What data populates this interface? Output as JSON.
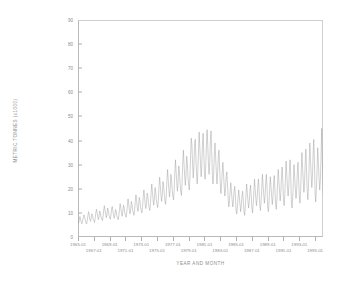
{
  "chart_data": {
    "type": "line",
    "title": "",
    "xlabel": "YEAR AND MONTH",
    "ylabel": "METRIC TONNES (x1000)",
    "ylim": [
      0,
      90
    ],
    "yticks": [
      0,
      10,
      20,
      30,
      40,
      50,
      60,
      70,
      80,
      90
    ],
    "ytick_labels": [
      "0",
      "10",
      "20",
      "30",
      "40",
      "50",
      "60",
      "70",
      "80",
      "90"
    ],
    "grid": false,
    "legend": null,
    "line_color": "#999999",
    "xlim_labels": [
      "1965.01",
      "1995.12"
    ],
    "xticks_top_row": [
      "1965.01",
      "1969.01",
      "1973.01",
      "1977.01",
      "1981.01",
      "1985.01",
      "1989.01",
      "1993.01"
    ],
    "xticks_bottom_row": [
      "1967.01",
      "1971.01",
      "1975.01",
      "1979.01",
      "1983.01",
      "1987.01",
      "1991.01",
      "1995.01"
    ],
    "x_start_year": 1965,
    "x_end_year": 1996,
    "series": [
      {
        "name": "monthly landings",
        "values": [
          6.5,
          5.8,
          7.2,
          8.5,
          7.0,
          6.2,
          5.5,
          6.8,
          8.0,
          9.2,
          8.4,
          7.1,
          6.0,
          5.4,
          6.6,
          8.8,
          10.5,
          9.0,
          7.4,
          6.5,
          7.8,
          9.6,
          8.8,
          7.5,
          6.8,
          6.0,
          7.5,
          9.8,
          11.5,
          10.2,
          8.5,
          7.2,
          8.6,
          10.8,
          9.8,
          8.2,
          7.5,
          6.8,
          8.4,
          11.0,
          13.0,
          11.2,
          9.4,
          8.0,
          9.5,
          12.0,
          11.0,
          9.0,
          8.2,
          7.4,
          9.0,
          11.8,
          12.6,
          10.8,
          9.0,
          7.8,
          9.2,
          11.4,
          10.6,
          8.8,
          8.0,
          7.2,
          8.8,
          11.4,
          13.8,
          12.0,
          10.0,
          8.6,
          10.4,
          13.2,
          12.2,
          10.0,
          9.0,
          8.2,
          10.0,
          13.2,
          15.8,
          13.6,
          11.2,
          9.6,
          11.6,
          14.8,
          13.6,
          11.2,
          10.0,
          9.0,
          11.2,
          14.8,
          17.5,
          15.0,
          12.4,
          10.6,
          12.8,
          16.4,
          15.0,
          12.4,
          11.0,
          10.0,
          12.4,
          16.5,
          19.5,
          16.8,
          13.8,
          11.8,
          14.2,
          18.2,
          16.8,
          13.8,
          12.2,
          11.0,
          13.8,
          18.5,
          22.0,
          18.8,
          15.4,
          13.2,
          16.0,
          20.5,
          18.8,
          15.4,
          13.5,
          12.2,
          15.4,
          20.8,
          24.8,
          21.2,
          17.4,
          14.8,
          18.0,
          23.0,
          21.2,
          17.4,
          15.0,
          13.6,
          17.2,
          23.4,
          28.0,
          23.8,
          19.6,
          16.6,
          20.2,
          26.0,
          23.8,
          19.6,
          17.0,
          15.4,
          19.6,
          26.6,
          32.0,
          27.2,
          22.4,
          19.0,
          23.0,
          29.5,
          27.0,
          22.2,
          19.0,
          17.2,
          22.0,
          30.0,
          36.0,
          30.6,
          25.2,
          21.4,
          26.0,
          33.5,
          30.5,
          25.0,
          21.5,
          19.5,
          25.0,
          34.0,
          41.0,
          38.0,
          30.0,
          24.5,
          29.5,
          38.0,
          40.5,
          33.0,
          26.0,
          22.0,
          28.0,
          36.0,
          43.5,
          37.0,
          30.5,
          25.0,
          30.0,
          38.5,
          43.0,
          35.0,
          27.0,
          24.0,
          30.0,
          38.0,
          44.5,
          38.0,
          31.0,
          26.0,
          31.0,
          40.0,
          44.0,
          36.0,
          26.0,
          22.0,
          27.0,
          34.0,
          39.0,
          33.0,
          27.0,
          22.0,
          26.5,
          33.0,
          36.0,
          29.0,
          22.0,
          18.0,
          22.0,
          27.0,
          31.0,
          26.0,
          21.0,
          17.0,
          20.0,
          25.0,
          27.0,
          22.0,
          16.0,
          12.5,
          15.0,
          19.0,
          22.5,
          19.0,
          15.5,
          12.5,
          15.0,
          19.0,
          21.0,
          17.0,
          11.0,
          9.5,
          12.0,
          16.0,
          19.5,
          16.5,
          13.5,
          10.5,
          13.0,
          17.0,
          19.0,
          15.0,
          10.5,
          9.0,
          12.5,
          17.5,
          22.0,
          18.5,
          15.0,
          12.0,
          14.5,
          19.0,
          21.5,
          17.0,
          12.0,
          10.0,
          13.5,
          19.0,
          24.0,
          20.0,
          16.0,
          13.0,
          16.0,
          21.0,
          24.0,
          19.0,
          13.0,
          11.0,
          14.5,
          20.0,
          26.0,
          21.5,
          17.5,
          14.0,
          17.0,
          22.5,
          26.0,
          20.5,
          12.5,
          10.5,
          14.0,
          19.5,
          25.0,
          21.0,
          17.0,
          13.5,
          16.5,
          22.0,
          25.5,
          20.0,
          14.0,
          11.5,
          15.5,
          22.0,
          28.0,
          23.5,
          19.0,
          15.0,
          18.5,
          25.0,
          29.0,
          22.5,
          15.5,
          13.0,
          17.5,
          24.5,
          31.5,
          26.0,
          21.0,
          17.0,
          20.5,
          27.5,
          32.0,
          25.0,
          14.5,
          12.0,
          16.5,
          23.0,
          30.0,
          25.0,
          20.0,
          16.0,
          19.5,
          26.5,
          31.0,
          24.0,
          17.0,
          14.0,
          19.0,
          27.0,
          35.0,
          29.0,
          23.5,
          18.5,
          22.5,
          31.0,
          36.5,
          28.0,
          19.0,
          15.5,
          21.0,
          30.0,
          39.0,
          32.0,
          26.0,
          20.5,
          25.0,
          34.5,
          40.5,
          31.0,
          18.0,
          14.5,
          20.0,
          28.5,
          37.0,
          30.5,
          24.5,
          19.5,
          23.5,
          33.0,
          45.0,
          33.0,
          20.0,
          16.0,
          22.0,
          32.0,
          42.0,
          34.5,
          27.5,
          22.0,
          26.5,
          37.0,
          46.0,
          35.0,
          17.0,
          14.0,
          19.5,
          28.0,
          37.0,
          31.0,
          25.0,
          19.5,
          24.0,
          34.0,
          42.0,
          32.0,
          22.0,
          17.5,
          24.0,
          35.0,
          46.0,
          38.0,
          30.0,
          24.0,
          29.0,
          41.0,
          52.0,
          38.0,
          24.0,
          19.0,
          26.5,
          38.5,
          50.0,
          41.0,
          33.0,
          26.0,
          32.0,
          45.0,
          57.0,
          42.0,
          22.0,
          18.0,
          25.0,
          36.0,
          47.0,
          39.0,
          31.0,
          25.0,
          30.0,
          43.0,
          55.0,
          40.0,
          28.0,
          22.0,
          31.0,
          45.0,
          59.0,
          48.0,
          38.0,
          30.0,
          37.0,
          52.0,
          68.0,
          50.0,
          26.0,
          21.0,
          29.0,
          42.0,
          55.0,
          45.0,
          36.0,
          28.0,
          34.0,
          49.0,
          77.0,
          52.0,
          24.0,
          19.5,
          27.0,
          39.0,
          51.0,
          42.0,
          33.0,
          26.0,
          32.0,
          46.0,
          62.0,
          46.0,
          27.0,
          22.0,
          30.0,
          43.0,
          56.0,
          46.0,
          37.0,
          29.0,
          35.0,
          50.0,
          70.0,
          53.0,
          26.0,
          21.0,
          29.0,
          41.0,
          54.0,
          44.0,
          35.0,
          28.0,
          34.0,
          48.0,
          60.0,
          48.0
        ]
      }
    ]
  }
}
